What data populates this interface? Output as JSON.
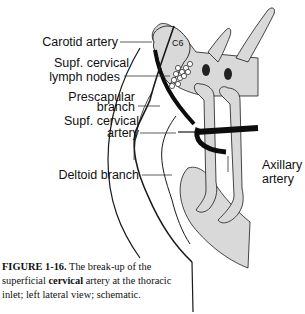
{
  "figure": {
    "labels": {
      "carotid_artery": "Carotid artery",
      "supf_cervical_lymph_line1": "Supf. cervical",
      "supf_cervical_lymph_line2": "lymph nodes",
      "prescapular_line1": "Prescapular",
      "prescapular_line2": "branch",
      "supf_cervical_artery_line1": "Supf. cervical",
      "supf_cervical_artery_line2": "artery",
      "deltoid_branch": "Deltoid branch",
      "axillary_line1": "Axillary",
      "axillary_line2": "artery",
      "vertebra": "C6"
    },
    "caption": {
      "number": "FIGURE 1-16.",
      "text_before_bold": " The break-up of the superficial ",
      "bold_word": "cervical",
      "text_after_bold": " artery at the thoracic inlet; left lateral view; schematic."
    },
    "colors": {
      "bone_fill": "#d9d9d9",
      "outline": "#1a1a1a",
      "artery": "#0d0d0d",
      "background": "#ffffff"
    }
  }
}
